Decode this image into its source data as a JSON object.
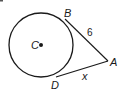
{
  "diagram": {
    "type": "circle-tangents",
    "circle": {
      "center_label": "C",
      "cx": 41,
      "cy": 45,
      "r": 32
    },
    "points": {
      "B": {
        "label": "B",
        "x": 65,
        "y": 19
      },
      "A": {
        "label": "A",
        "x": 108,
        "y": 61
      },
      "D": {
        "label": "D",
        "x": 56,
        "y": 77
      }
    },
    "segments": [
      {
        "from": "B",
        "to": "A",
        "label": "6"
      },
      {
        "from": "D",
        "to": "A",
        "label": "x"
      }
    ],
    "colors": {
      "stroke": "#1a1a1a",
      "background": "#ffffff"
    }
  }
}
